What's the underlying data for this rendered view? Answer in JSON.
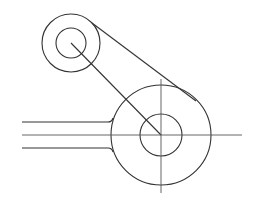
{
  "diagram": {
    "type": "mechanical-link-drawing",
    "stroke_color": "#333333",
    "background": "#ffffff",
    "small_boss": {
      "cx": 71,
      "cy": 43,
      "outer_r": 29,
      "inner_r": 15
    },
    "large_boss": {
      "cx": 161,
      "cy": 135,
      "outer_r": 50,
      "inner_r": 21
    },
    "arm": {
      "x_start": 22,
      "y_top": 122,
      "y_center": 135,
      "y_bottom": 148
    },
    "centerlines": {
      "horizontal": [
        22,
        242
      ],
      "vertical": [
        79,
        193
      ]
    }
  }
}
